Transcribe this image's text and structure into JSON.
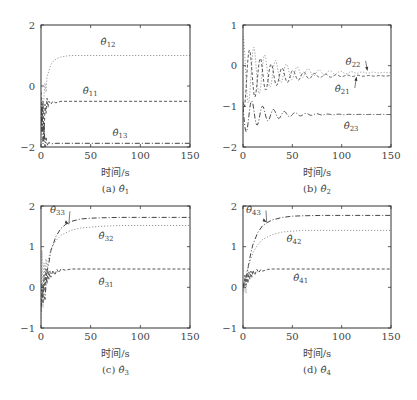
{
  "chart_data": [
    {
      "type": "line",
      "id": "a",
      "caption": "(a)",
      "caption_symbol": "θ̂",
      "caption_sub": "1",
      "xlabel": "时间/s",
      "ylabel": "",
      "xlim": [
        0,
        150
      ],
      "ylim": [
        -2,
        2
      ],
      "xticks": [
        0,
        50,
        100,
        150
      ],
      "yticks": [
        -2,
        0,
        2
      ],
      "grid": false,
      "box": {
        "left": 41,
        "right": 190,
        "top": 25,
        "bottom": 147
      },
      "series": [
        {
          "name": "θ̂12",
          "sub": "12",
          "style": "dotted",
          "color": "#9a9a9a",
          "x": [
            0,
            1,
            2,
            3,
            4,
            5,
            6,
            8,
            10,
            12,
            15,
            20,
            25,
            30,
            40,
            60,
            150
          ],
          "y": [
            -1.6,
            -0.4,
            -1.0,
            -0.3,
            0.1,
            -0.2,
            0.3,
            0.5,
            0.7,
            0.8,
            0.88,
            0.95,
            0.98,
            1.0,
            1.0,
            1.0,
            1.0
          ],
          "label_pos": [
            60,
            1.35
          ]
        },
        {
          "name": "θ̂11",
          "sub": "11",
          "style": "dashed",
          "color": "#555555",
          "x": [
            0,
            1,
            2,
            3,
            4,
            5,
            6,
            7,
            8,
            10,
            12,
            15,
            20,
            30,
            150
          ],
          "y": [
            -0.2,
            -1.5,
            -0.5,
            -1.8,
            -0.6,
            -0.9,
            -0.4,
            -0.7,
            -0.5,
            -0.6,
            -0.5,
            -0.55,
            -0.5,
            -0.5,
            -0.5
          ],
          "label_pos": [
            42,
            -0.25
          ]
        },
        {
          "name": "θ̂13",
          "sub": "13",
          "style": "dashdot",
          "color": "#444444",
          "x": [
            0,
            1,
            2,
            3,
            4,
            5,
            6,
            8,
            10,
            15,
            150
          ],
          "y": [
            -1.5,
            -0.6,
            -1.9,
            -1.2,
            -2.0,
            -1.7,
            -1.95,
            -1.85,
            -1.9,
            -1.88,
            -1.88
          ],
          "label_pos": [
            72,
            -1.65
          ]
        }
      ]
    },
    {
      "type": "line",
      "id": "b",
      "caption": "(b)",
      "caption_symbol": "θ̂",
      "caption_sub": "2",
      "xlabel": "时间/s",
      "ylabel": "",
      "xlim": [
        0,
        150
      ],
      "ylim": [
        -2,
        1
      ],
      "xticks": [
        0,
        50,
        100,
        150
      ],
      "yticks": [
        -2,
        -1,
        0,
        1
      ],
      "grid": false,
      "box": {
        "left": 243,
        "right": 391,
        "top": 25,
        "bottom": 147
      },
      "series": [
        {
          "name": "θ̂22",
          "sub": "22",
          "style": "dotted",
          "color": "#9a9a9a",
          "decay": {
            "final": -0.17,
            "amp": 0.9,
            "period": 11,
            "tau": 30,
            "phase": 0
          }
        },
        {
          "name": "θ̂21",
          "sub": "21",
          "style": "dashed",
          "color": "#555555",
          "decay": {
            "final": -0.25,
            "amp": 0.8,
            "period": 11,
            "tau": 28,
            "phase": 2.5
          }
        },
        {
          "name": "θ̂23",
          "sub": "23",
          "style": "dashdot",
          "color": "#444444",
          "decay": {
            "final": -1.2,
            "amp": 0.5,
            "period": 11,
            "tau": 22,
            "phase": 1.2
          }
        }
      ],
      "annotations": [
        {
          "text": "θ̂22",
          "sub": "22",
          "pos": [
            104,
            0.02
          ],
          "arrow_to": [
            126,
            -0.12
          ]
        },
        {
          "text": "θ̂21",
          "sub": "21",
          "pos": [
            93,
            -0.65
          ],
          "arrow_to": [
            115,
            -0.28
          ]
        },
        {
          "text": "θ̂23",
          "sub": "23",
          "pos": [
            102,
            -1.55
          ]
        }
      ]
    },
    {
      "type": "line",
      "id": "c",
      "caption": "(c)",
      "caption_symbol": "θ̂",
      "caption_sub": "3",
      "xlabel": "时间/s",
      "ylabel": "",
      "xlim": [
        0,
        150
      ],
      "ylim": [
        -1,
        2
      ],
      "xticks": [
        0,
        50,
        100,
        150
      ],
      "yticks": [
        -1,
        0,
        1,
        2
      ],
      "grid": false,
      "box": {
        "left": 41,
        "right": 190,
        "top": 206,
        "bottom": 328
      },
      "series": [
        {
          "name": "θ̂33",
          "sub": "33",
          "style": "dashdot",
          "color": "#444444",
          "x": [
            0,
            2,
            4,
            6,
            8,
            10,
            15,
            20,
            25,
            30,
            40,
            50,
            60,
            80,
            150
          ],
          "y": [
            -0.5,
            0.0,
            -0.3,
            0.4,
            0.6,
            0.9,
            1.25,
            1.45,
            1.55,
            1.62,
            1.68,
            1.7,
            1.71,
            1.72,
            1.72
          ],
          "label_pos": [
            9,
            1.82
          ],
          "arrow_to": [
            28,
            1.55
          ]
        },
        {
          "name": "θ̂32",
          "sub": "32",
          "style": "dotted",
          "color": "#9a9a9a",
          "x": [
            0,
            1,
            2,
            3,
            4,
            5,
            6,
            8,
            10,
            15,
            20,
            30,
            40,
            60,
            80,
            150
          ],
          "y": [
            -0.9,
            0.9,
            -0.5,
            0.6,
            0.2,
            0.7,
            0.5,
            0.75,
            0.95,
            1.15,
            1.28,
            1.4,
            1.46,
            1.5,
            1.52,
            1.52
          ],
          "label_pos": [
            58,
            1.2
          ]
        },
        {
          "name": "θ̂31",
          "sub": "31",
          "style": "dashed",
          "color": "#555555",
          "x": [
            0,
            1,
            2,
            3,
            4,
            5,
            6,
            7,
            8,
            9,
            10,
            12,
            14,
            16,
            18,
            20,
            25,
            30,
            150
          ],
          "y": [
            -0.6,
            0.1,
            -0.4,
            0.3,
            -0.1,
            0.45,
            0.1,
            0.42,
            0.2,
            0.4,
            0.25,
            0.42,
            0.3,
            0.44,
            0.36,
            0.45,
            0.42,
            0.45,
            0.45
          ],
          "label_pos": [
            58,
            0.05
          ]
        }
      ]
    },
    {
      "type": "line",
      "id": "d",
      "caption": "(d)",
      "caption_symbol": "θ̂",
      "caption_sub": "4",
      "xlabel": "时间/s",
      "ylabel": "",
      "xlim": [
        0,
        150
      ],
      "ylim": [
        -1,
        2
      ],
      "xticks": [
        0,
        50,
        100,
        150
      ],
      "yticks": [
        -1,
        0,
        1,
        2
      ],
      "grid": false,
      "box": {
        "left": 243,
        "right": 391,
        "top": 206,
        "bottom": 328
      },
      "series": [
        {
          "name": "θ̂43",
          "sub": "43",
          "style": "dashdot",
          "color": "#444444",
          "x": [
            0,
            2,
            4,
            6,
            8,
            10,
            15,
            20,
            25,
            30,
            40,
            50,
            60,
            80,
            150
          ],
          "y": [
            0.0,
            0.2,
            0.3,
            0.6,
            0.85,
            1.05,
            1.35,
            1.52,
            1.6,
            1.66,
            1.72,
            1.75,
            1.76,
            1.77,
            1.77
          ],
          "label_pos": [
            3,
            1.84
          ],
          "arrow_to": [
            24,
            1.6
          ]
        },
        {
          "name": "θ̂42",
          "sub": "42",
          "style": "dotted",
          "color": "#9a9a9a",
          "x": [
            0,
            1,
            2,
            3,
            4,
            6,
            8,
            10,
            15,
            20,
            30,
            40,
            50,
            60,
            80,
            150
          ],
          "y": [
            0.0,
            -0.1,
            0.3,
            -0.15,
            0.4,
            0.55,
            0.7,
            0.85,
            1.05,
            1.18,
            1.3,
            1.36,
            1.38,
            1.4,
            1.4,
            1.4
          ],
          "label_pos": [
            44,
            1.12
          ]
        },
        {
          "name": "θ̂41",
          "sub": "41",
          "style": "dashed",
          "color": "#555555",
          "x": [
            0,
            1,
            2,
            3,
            4,
            5,
            6,
            7,
            8,
            9,
            10,
            12,
            14,
            16,
            18,
            20,
            25,
            30,
            150
          ],
          "y": [
            0.1,
            0.0,
            0.3,
            0.05,
            0.35,
            0.1,
            0.38,
            0.2,
            0.4,
            0.25,
            0.42,
            0.3,
            0.44,
            0.36,
            0.44,
            0.4,
            0.44,
            0.45,
            0.45
          ],
          "label_pos": [
            51,
            0.15
          ]
        }
      ]
    }
  ]
}
